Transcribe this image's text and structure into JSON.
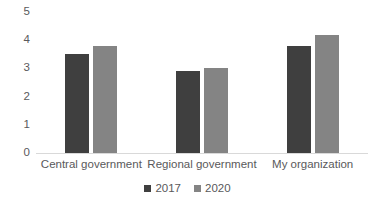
{
  "chart_data": {
    "type": "bar",
    "title": "",
    "subtitle": "",
    "xlabel": "",
    "ylabel": "",
    "categories": [
      "Central government",
      "Regional government",
      "My organization"
    ],
    "series": [
      {
        "name": "2017",
        "color": "#3f3f3f",
        "values": [
          3.5,
          2.9,
          3.8
        ]
      },
      {
        "name": "2020",
        "color": "#848484",
        "values": [
          3.8,
          3.0,
          4.2
        ]
      }
    ],
    "ylim": [
      0,
      5
    ],
    "ytick_labels": [
      "0",
      "1",
      "2",
      "3",
      "4",
      "5"
    ],
    "ytick_values": [
      0,
      1,
      2,
      3,
      4,
      5
    ],
    "grid": false,
    "legend_position": "bottom",
    "annotations": []
  },
  "legend": {
    "items": [
      {
        "label": "2017",
        "swatch": "legend-swatch-2017"
      },
      {
        "label": "2020",
        "swatch": "legend-swatch-2020"
      }
    ]
  },
  "colors": {
    "series_2017": "#3f3f3f",
    "series_2020": "#848484",
    "axis_line": "#d9d9d9",
    "text": "#59595b",
    "background": "#ffffff"
  }
}
